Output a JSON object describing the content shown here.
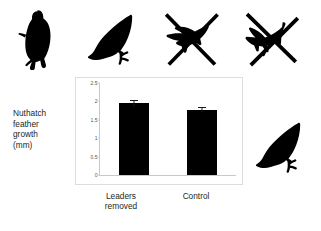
{
  "figure": {
    "background_color": "#ffffff",
    "ink_color": "#000000"
  },
  "axis_title": "Nuthatch\nfeather\ngrowth\n(mm)",
  "illustrations": [
    {
      "icon": "nuthatch-upright-silhouette-icon",
      "label": "nuthatch clinging upright to trunk"
    },
    {
      "icon": "nuthatch-wing-raised-silhouette-icon",
      "label": "nuthatch with raised wing"
    },
    {
      "icon": "nuthatch-crossed-out-silhouette-icon",
      "label": "nuthatch crossed out"
    },
    {
      "icon": "nuthatch-crossed-out-silhouette-icon",
      "label": "nuthatch crossed out"
    },
    {
      "icon": "nuthatch-wing-raised-silhouette-icon",
      "label": "nuthatch with raised wing"
    }
  ],
  "chart_data": {
    "type": "bar",
    "title": "",
    "subtitle": "",
    "xlabel": "",
    "ylabel": "Nuthatch feather growth (mm)",
    "categories": [
      "Leaders\nremoved",
      "Control"
    ],
    "category_labels_plain": [
      "Leaders removed",
      "Control"
    ],
    "values": [
      1.95,
      1.78
    ],
    "errors": [
      0.09,
      0.06
    ],
    "error_type": "standard error bars",
    "ylim": [
      0,
      2.5
    ],
    "yticks": [
      0,
      0.5,
      1,
      1.5,
      2,
      2.5
    ],
    "ytick_labels": [
      "0",
      "0.5",
      "1",
      "1.5",
      "2",
      "2.5"
    ],
    "grid": false,
    "legend": false,
    "bar_color": "#000000",
    "axis_color": "#c9c9c9",
    "frame_color": "#dddddd"
  }
}
